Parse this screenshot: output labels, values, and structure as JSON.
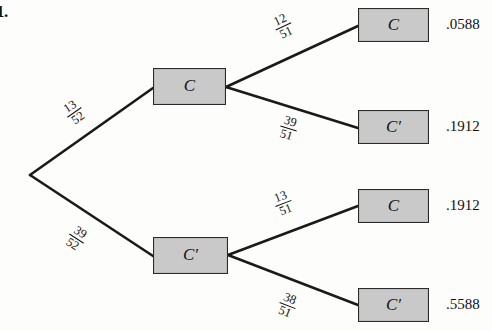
{
  "problem": {
    "number": "1."
  },
  "tree": {
    "root": {
      "x": 30,
      "y": 175
    },
    "internal_nodes": [
      {
        "name": "node-c",
        "label": "C",
        "x": 153,
        "y": 68,
        "w": 73,
        "h": 37
      },
      {
        "name": "node-c-prime",
        "label": "C′",
        "x": 153,
        "y": 237,
        "w": 75,
        "h": 37
      }
    ],
    "leaf_nodes": [
      {
        "name": "leaf-cc",
        "label": "C",
        "value": ".0588",
        "x": 358,
        "y": 8,
        "w": 71,
        "h": 34
      },
      {
        "name": "leaf-cc-prime",
        "label": "C′",
        "value": ".1912",
        "x": 358,
        "y": 110,
        "w": 71,
        "h": 34
      },
      {
        "name": "leaf-c-prime-c",
        "label": "C",
        "value": ".1912",
        "x": 358,
        "y": 189,
        "w": 71,
        "h": 34
      },
      {
        "name": "leaf-c-prime-c-prime",
        "label": "C′",
        "value": ".5588",
        "x": 358,
        "y": 288,
        "w": 71,
        "h": 34
      }
    ],
    "branches": [
      {
        "name": "branch-root-c",
        "numerator": "13",
        "denominator": "52",
        "x1": 30,
        "y1": 175,
        "x2": 153,
        "y2": 88,
        "label_x": 74,
        "label_y": 112,
        "label_rot": -35
      },
      {
        "name": "branch-root-c-prime",
        "numerator": "39",
        "denominator": "52",
        "x1": 30,
        "y1": 175,
        "x2": 153,
        "y2": 256,
        "label_x": 76,
        "label_y": 238,
        "label_rot": 33
      },
      {
        "name": "branch-c-c",
        "numerator": "12",
        "denominator": "51",
        "x1": 226,
        "y1": 87,
        "x2": 358,
        "y2": 26,
        "label_x": 283,
        "label_y": 26,
        "label_rot": -25
      },
      {
        "name": "branch-c-c-prime",
        "numerator": "39",
        "denominator": "51",
        "x1": 226,
        "y1": 87,
        "x2": 358,
        "y2": 128,
        "label_x": 288,
        "label_y": 128,
        "label_rot": 17
      },
      {
        "name": "branch-c-prime-c",
        "numerator": "13",
        "denominator": "51",
        "x1": 228,
        "y1": 255,
        "x2": 358,
        "y2": 206,
        "label_x": 283,
        "label_y": 203,
        "label_rot": -21
      },
      {
        "name": "branch-c-prime-c-prime",
        "numerator": "38",
        "denominator": "51",
        "x1": 228,
        "y1": 255,
        "x2": 358,
        "y2": 305,
        "label_x": 287,
        "label_y": 305,
        "label_rot": 21
      }
    ]
  },
  "colors": {
    "box_fill": "#c9c9c9",
    "box_border": "#2a2a2a",
    "line": "#1a1a1a",
    "text": "#111111",
    "background": "#fdfdfc"
  }
}
